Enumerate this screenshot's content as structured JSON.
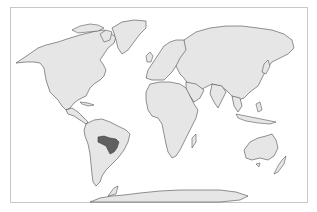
{
  "map": {
    "type": "world-locator-map",
    "projection": "Robinson-like",
    "highlighted_region": {
      "name": "Pantanal / Chaco region (Brazil–Bolivia–Paraguay)",
      "continent": "South America",
      "fill_color": "#606060"
    },
    "colors": {
      "land": "#e6e6e6",
      "coastline": "#3a3a3a",
      "ocean": "#ffffff",
      "frame": "#c8c8c8"
    },
    "continents": [
      "North America",
      "Greenland",
      "South America",
      "Europe",
      "Africa",
      "Asia",
      "Australia",
      "New Zealand",
      "Antarctica"
    ]
  }
}
